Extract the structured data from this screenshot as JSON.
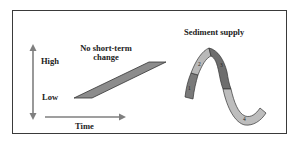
{
  "figure": {
    "left_panel": {
      "y_axis": {
        "high_label": "High",
        "low_label": "Low"
      },
      "x_axis": {
        "label": "Time"
      },
      "series_title": "No short-term change"
    },
    "right_panel": {
      "title": "Sediment supply",
      "segments": [
        {
          "number": "1",
          "shade": "dark",
          "color": "#7a7a7a"
        },
        {
          "number": "2",
          "shade": "light",
          "color": "#b9b9b9"
        },
        {
          "number": "3",
          "shade": "dark",
          "color": "#6e6e6e"
        },
        {
          "number": "4",
          "shade": "light",
          "color": "#bdbdbd"
        }
      ]
    },
    "colors": {
      "border": "#3a3a3a",
      "arrow": "#7f7f7f",
      "parallelogram_fill": "#8c8c8c",
      "outline": "#333333"
    }
  }
}
